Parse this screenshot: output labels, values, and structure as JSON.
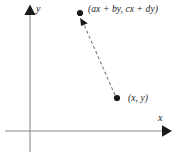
{
  "figure": {
    "kind": "linear-transformation-diagram",
    "background_color": "#ffffff",
    "width": 181,
    "height": 156
  },
  "axes": {
    "x_label": "x",
    "y_label": "y",
    "axis_color": "#8a8a8a",
    "arrow_color": "#1a1a1a",
    "origin": {
      "x": 30,
      "y": 131
    },
    "x_axis": {
      "start_x": 5,
      "end_x": 171,
      "y": 131
    },
    "y_axis": {
      "x": 30,
      "start_y": 152,
      "end_y": 5
    }
  },
  "points": [
    {
      "id": "source-point",
      "label": "(x, y)",
      "x": 117,
      "y": 98,
      "dot_color": "#1a1a1a",
      "dot_radius": 3.1
    },
    {
      "id": "image-point",
      "label": "(ax + by, cx + dy)",
      "x": 80,
      "y": 13,
      "dot_color": "#1a1a1a",
      "dot_radius": 3.1
    }
  ],
  "connector": {
    "id": "transformation-arrow",
    "style": "dashed",
    "color": "#6f6f6f",
    "dash_pattern": "3 2.6",
    "from": {
      "x": 115,
      "y": 95
    },
    "to": {
      "x": 82,
      "y": 20
    },
    "arrowhead_color": "#1a1a1a",
    "arrowhead_at": "to"
  }
}
